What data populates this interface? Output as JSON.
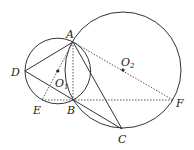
{
  "diagram": {
    "type": "geometry",
    "circles": [
      {
        "name": "O1",
        "cx": 57.8,
        "cy": 71,
        "r": 32.8
      },
      {
        "name": "O2",
        "cx": 123,
        "cy": 70,
        "r": 58
      }
    ],
    "points": {
      "A": {
        "x": 73,
        "y": 42,
        "label": "A"
      },
      "B": {
        "x": 73,
        "y": 100,
        "label": "B"
      },
      "C": {
        "x": 122,
        "y": 129,
        "label": "C"
      },
      "D": {
        "x": 25,
        "y": 71,
        "label": "D"
      },
      "E": {
        "x": 42,
        "y": 100,
        "label": "E"
      },
      "F": {
        "x": 173,
        "y": 100,
        "label": "F"
      },
      "O1": {
        "x": 57.8,
        "y": 71,
        "label": "O",
        "sub": "1"
      },
      "O2": {
        "x": 123,
        "y": 70,
        "label": "O",
        "sub": "2"
      }
    },
    "solid_segments": [
      [
        "A",
        "D"
      ],
      [
        "D",
        "C"
      ],
      [
        "A",
        "C"
      ]
    ],
    "dotted_segments": [
      [
        "A",
        "E"
      ],
      [
        "A",
        "B"
      ],
      [
        "A",
        "F"
      ],
      [
        "E",
        "F"
      ]
    ]
  },
  "labels": {
    "A": "A",
    "B": "B",
    "C": "C",
    "D": "D",
    "E": "E",
    "F": "F",
    "O": "O",
    "sub1": "1",
    "sub2": "2"
  }
}
